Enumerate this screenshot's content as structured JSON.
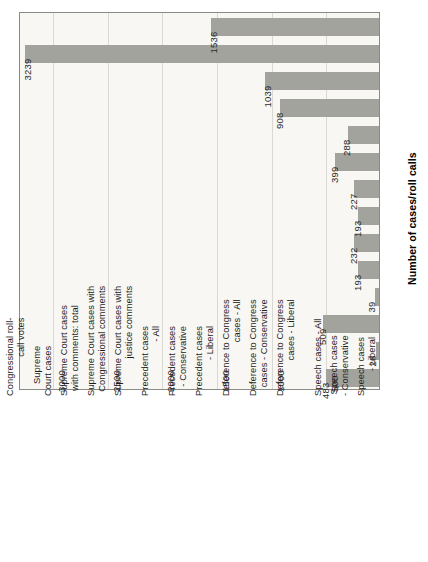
{
  "chart_data": {
    "type": "bar",
    "orientation": "rotated-vertical-bars",
    "title": "",
    "subtitle": "",
    "xlabel": "",
    "ylabel": "Number of cases/roll calls",
    "ylim": [
      0,
      3300
    ],
    "grid": true,
    "legend": null,
    "tick_labels": [
      "500",
      "1000",
      "1500",
      "2000",
      "2500",
      "3000"
    ],
    "ticks": [
      500,
      1000,
      1500,
      2000,
      2500,
      3000
    ],
    "categories": [
      "Congressional roll-\ncall votes",
      "Supreme\nCourt cases",
      "Supreme Court cases\nwith comments: total",
      "Supreme Court cases with\nCongressional comments",
      "Supreme Court cases with\njustice comments",
      "Precedent cases\n- All",
      "Precedent cases\n- Conservative",
      "Precedent cases\n- Liberal",
      "Deference to Congress\ncases - All",
      "Deference to Congress\ncases - Conservative",
      "Deference to Congress\ncases - Liberal",
      "Speech cases - All",
      "Speech cases\n- Conservative",
      "Speech cases\n- Liberal"
    ],
    "values": [
      1536,
      3239,
      1039,
      908,
      288,
      399,
      227,
      193,
      232,
      193,
      39,
      509,
      26,
      483
    ],
    "value_labels": [
      "1536",
      "3239",
      "1039",
      "908",
      "288",
      "399",
      "227",
      "193",
      "232",
      "193",
      "39",
      "509",
      "26",
      "483"
    ],
    "colors": {
      "bar": "#a3a39e",
      "panel_background": "#f8f7f4",
      "gridline": "#d9d8d3",
      "frame": "#8a8a86",
      "text": "#1d1d1b"
    }
  }
}
